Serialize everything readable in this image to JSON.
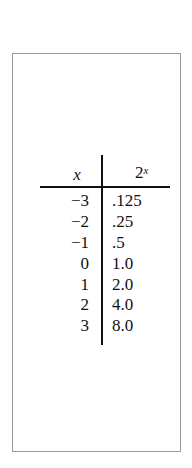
{
  "table": {
    "header": {
      "x": "x",
      "y_base": "2",
      "y_exp": "x"
    },
    "rows": [
      {
        "x": "−3",
        "y": ".125"
      },
      {
        "x": "−2",
        "y": ".25"
      },
      {
        "x": "−1",
        "y": ".5"
      },
      {
        "x": "0",
        "y": "1.0"
      },
      {
        "x": "1",
        "y": "2.0"
      },
      {
        "x": "2",
        "y": "4.0"
      },
      {
        "x": "3",
        "y": "8.0"
      }
    ]
  }
}
